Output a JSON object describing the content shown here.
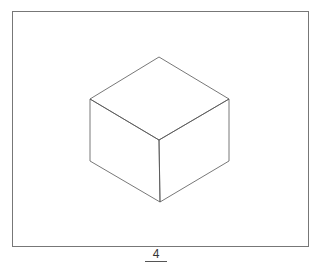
{
  "figure": {
    "type": "isometric-cube",
    "frame": {
      "x": 12,
      "y": 11,
      "width": 296,
      "height": 235,
      "stroke": "#777777"
    },
    "stroke_color": "#555555",
    "vertices": {
      "top": [
        159,
        57
      ],
      "upper_left": [
        90,
        99
      ],
      "upper_right": [
        229,
        99
      ],
      "center": [
        159,
        140
      ],
      "lower_left": [
        90,
        161
      ],
      "lower_right": [
        229,
        161
      ],
      "bottom": [
        160,
        202
      ]
    }
  },
  "caption": {
    "label": "4"
  }
}
